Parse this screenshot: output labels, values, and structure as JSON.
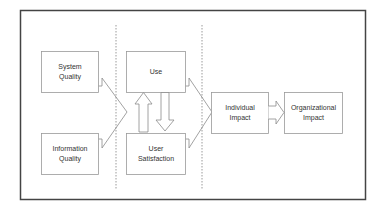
{
  "diagram": {
    "colors": {
      "frame": "#444444",
      "box_stroke": "#9a9a9a",
      "arrow_stroke": "#8a8a8a",
      "divider": "#9a9a9a",
      "text": "#333333",
      "background": "#ffffff"
    },
    "nodes": {
      "system_quality": {
        "line1": "System",
        "line2": "Quality"
      },
      "information_quality": {
        "line1": "Information",
        "line2": "Quality"
      },
      "use": {
        "line1": "Use",
        "line2": ""
      },
      "user_satisfaction": {
        "line1": "User",
        "line2": "Satisfaction"
      },
      "individual_impact": {
        "line1": "Individual",
        "line2": "Impact"
      },
      "organizational_impact": {
        "line1": "Organizational",
        "line2": "Impact"
      }
    },
    "connections": [
      {
        "from": "system_quality",
        "to": "use/user_satisfaction",
        "type": "merge-chevron"
      },
      {
        "from": "information_quality",
        "to": "use/user_satisfaction",
        "type": "merge-chevron"
      },
      {
        "from": "use",
        "to": "user_satisfaction",
        "type": "block-arrow-down"
      },
      {
        "from": "user_satisfaction",
        "to": "use",
        "type": "block-arrow-up"
      },
      {
        "from": "use/user_satisfaction",
        "to": "individual_impact",
        "type": "merge-chevron"
      },
      {
        "from": "individual_impact",
        "to": "organizational_impact",
        "type": "block-arrow-right"
      }
    ]
  }
}
